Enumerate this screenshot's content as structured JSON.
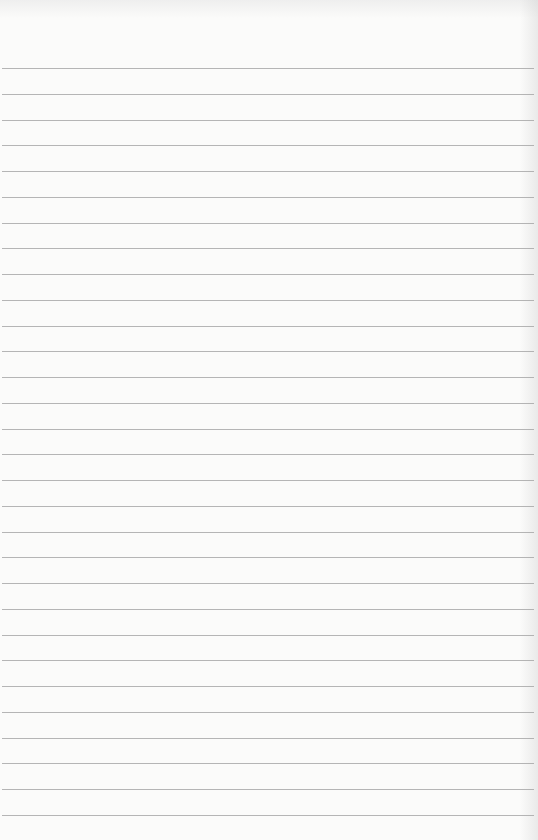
{
  "page": {
    "type": "lined-paper",
    "background_color": "#fbfbfa",
    "rule_color": "#a8a8a8",
    "rule_count": 30,
    "first_rule_y": 68,
    "rule_spacing": 25.75,
    "text": ""
  }
}
